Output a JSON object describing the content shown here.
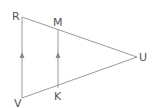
{
  "diagram": {
    "type": "geometry",
    "stroke_color": "#9a9a9a",
    "label_color": "#555555",
    "points": {
      "R": {
        "label": "R",
        "x": 22,
        "y": 17
      },
      "M": {
        "label": "M",
        "x": 58,
        "y": 29
      },
      "U": {
        "label": "U",
        "x": 137,
        "y": 57
      },
      "V": {
        "label": "V",
        "x": 22,
        "y": 98
      },
      "K": {
        "label": "K",
        "x": 58,
        "y": 88
      }
    },
    "segments": [
      {
        "from": "R",
        "to": "U"
      },
      {
        "from": "V",
        "to": "U"
      },
      {
        "from": "V",
        "to": "R",
        "parallel_marker": "arrow-up"
      },
      {
        "from": "K",
        "to": "M",
        "parallel_marker": "arrow-up"
      }
    ],
    "relations": [
      "RV ∥ MK"
    ]
  }
}
